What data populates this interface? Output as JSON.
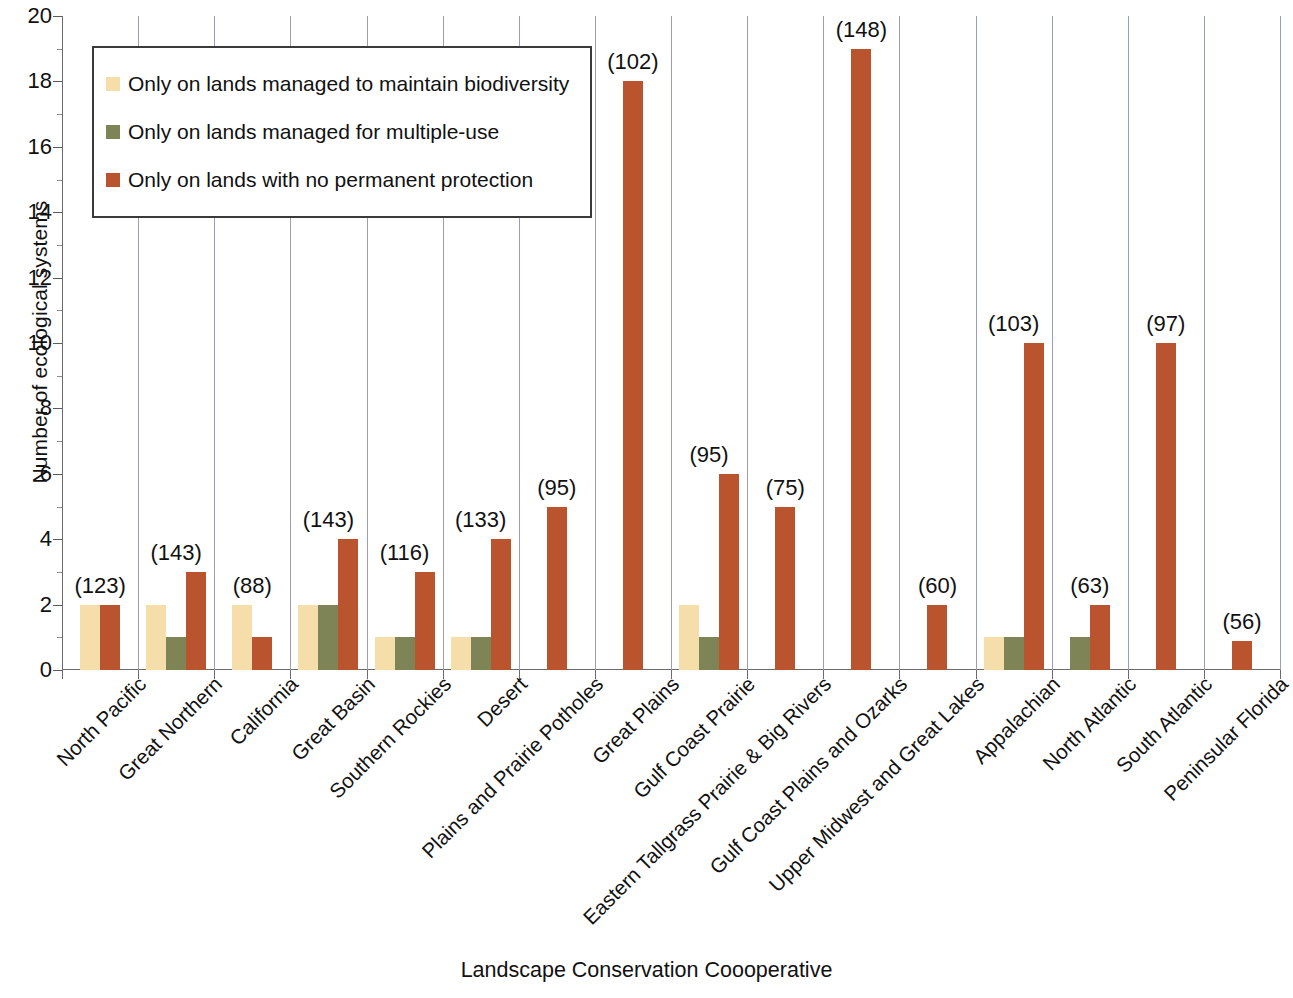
{
  "chart_data": {
    "type": "bar",
    "title": "",
    "xlabel": "Landscape Conservation Coooperative",
    "ylabel": "Number of ecological systems",
    "ylim": [
      0,
      20
    ],
    "ytick_step": 2,
    "yticks": [
      0,
      2,
      4,
      6,
      8,
      10,
      12,
      14,
      16,
      18,
      20
    ],
    "grid": "vertical",
    "legend_position": "upper-left-inside",
    "categories": [
      "North Pacific",
      "Great Northern",
      "California",
      "Great Basin",
      "Southern Rockies",
      "Desert",
      "Plains and Prairie Potholes",
      "Great Plains",
      "Gulf Coast Prairie",
      "Eastern Tallgrass Prairie & Big Rivers",
      "Gulf Coast Plains and Ozarks",
      "Upper Midwest and Great Lakes",
      "Appalachian",
      "North Atlantic",
      "South Atlantic",
      "Peninsular Florida"
    ],
    "series": [
      {
        "name": "Only on lands managed to maintain biodiversity",
        "color": "#f6deab",
        "values": [
          2,
          2,
          2,
          2,
          1,
          1,
          0,
          0,
          2,
          0,
          0,
          0,
          1,
          0,
          0,
          0
        ]
      },
      {
        "name": "Only on lands managed for multiple-use",
        "color": "#7f8457",
        "values": [
          0,
          1,
          0,
          2,
          1,
          1,
          0,
          0,
          1,
          0,
          0,
          0,
          1,
          1,
          0,
          0
        ]
      },
      {
        "name": "Only on lands with no permanent protection",
        "color": "#b9542f",
        "values": [
          2,
          3,
          1,
          4,
          3,
          4,
          5,
          18,
          6,
          5,
          19,
          2,
          10,
          2,
          10,
          0.9
        ]
      }
    ],
    "annotations": [
      {
        "category": "North Pacific",
        "text": "(123)"
      },
      {
        "category": "Great Northern",
        "text": "(143)"
      },
      {
        "category": "California",
        "text": "(88)"
      },
      {
        "category": "Great Basin",
        "text": "(143)"
      },
      {
        "category": "Southern Rockies",
        "text": "(116)"
      },
      {
        "category": "Desert",
        "text": "(133)"
      },
      {
        "category": "Plains and Prairie Potholes",
        "text": "(95)"
      },
      {
        "category": "Great Plains",
        "text": "(102)"
      },
      {
        "category": "Gulf Coast Prairie",
        "text": "(95)"
      },
      {
        "category": "Eastern Tallgrass Prairie & Big Rivers",
        "text": "(75)"
      },
      {
        "category": "Gulf Coast Plains and Ozarks",
        "text": "(148)"
      },
      {
        "category": "Upper Midwest and Great Lakes",
        "text": "(60)"
      },
      {
        "category": "Appalachian",
        "text": "(103)"
      },
      {
        "category": "North Atlantic",
        "text": "(63)"
      },
      {
        "category": "South Atlantic",
        "text": "(97)"
      },
      {
        "category": "Peninsular Florida",
        "text": "(56)"
      }
    ]
  }
}
